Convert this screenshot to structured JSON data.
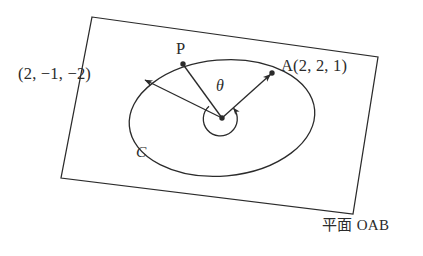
{
  "figure": {
    "title_text": "",
    "labels": {
      "coord_left": "(2, −1, −2)",
      "point_a": "A(2, 2, 1)",
      "point_p": "P",
      "angle_theta": "θ",
      "curve_c": "C",
      "plane_oab": "平面 OAB"
    },
    "colors": {
      "stroke": "#2b2b2b",
      "background": "#ffffff",
      "text": "#2b2b2b"
    },
    "geometry": {
      "plane_quad": [
        [
          92,
          17
        ],
        [
          378,
          57
        ],
        [
          353,
          214
        ],
        [
          61,
          178
        ]
      ],
      "ellipse": {
        "cx": 222,
        "cy": 118,
        "rx": 93,
        "ry": 58,
        "rotation_deg": -5
      },
      "center_point": [
        222,
        118
      ],
      "vector_to_a": {
        "from": [
          222,
          118
        ],
        "to": [
          272,
          73
        ],
        "label": "A(2, 2, 1)"
      },
      "vector_to_p": {
        "from": [
          222,
          118
        ],
        "to": [
          183,
          64
        ],
        "label": "P"
      },
      "vector_to_left": {
        "from": [
          222,
          118
        ],
        "to": [
          143,
          79
        ],
        "label": "(2, −1, −2)"
      },
      "angle_arc": {
        "center": [
          222,
          118
        ],
        "radius": 17,
        "between": [
          "P",
          "A"
        ]
      }
    }
  }
}
